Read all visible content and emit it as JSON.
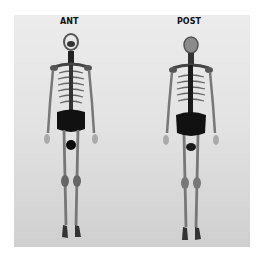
{
  "figure": {
    "type": "whole-body bone scan",
    "views": [
      {
        "id": "anterior",
        "label": "ANT"
      },
      {
        "id": "posterior",
        "label": "POST"
      }
    ],
    "colors": {
      "background": "#ffffff",
      "panel": "#e2e2e2",
      "uptake_dark": "#111111",
      "bone_mid": "#6a6a6a"
    }
  }
}
